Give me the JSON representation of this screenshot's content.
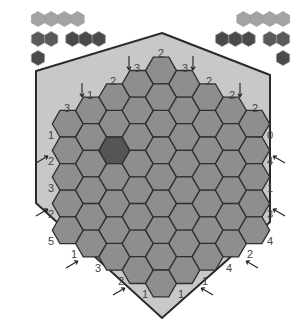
{
  "app": {
    "type": "hex-black-box-puzzle"
  },
  "colors": {
    "background": "#ffffff",
    "board_fill": "#c8c8c8",
    "board_border": "#2a2a2a",
    "cell_fill": "#8e8e8e",
    "cell_border": "#2f2f2f",
    "cell_marked": "#555555",
    "palette_light": "#a3a3a3",
    "palette_mid": "#5a5a5a",
    "palette_dark": "#4a4a4a",
    "label_text": "#444444"
  },
  "palette_left": {
    "rows": [
      {
        "groups": [
          {
            "count": 4,
            "shade": "light"
          }
        ]
      },
      {
        "groups": [
          {
            "count": 2,
            "shade": "mid"
          },
          {
            "count": 3,
            "shade": "dark"
          }
        ]
      },
      {
        "groups": [
          {
            "count": 1,
            "shade": "dark"
          }
        ]
      }
    ]
  },
  "palette_right": {
    "rows": [
      {
        "groups": [
          {
            "count": 4,
            "shade": "light"
          }
        ]
      },
      {
        "groups": [
          {
            "count": 3,
            "shade": "dark"
          },
          {
            "count": 2,
            "shade": "mid"
          }
        ]
      },
      {
        "groups": [
          {
            "count": 1,
            "shade": "dark"
          }
        ]
      }
    ]
  },
  "board": {
    "side": 5,
    "marked_cells": [
      [
        2,
        2
      ],
      [
        7,
        6
      ]
    ]
  },
  "edge_labels": [
    {
      "text": "2",
      "x": 161,
      "y": 53,
      "arrow": null
    },
    {
      "text": "3",
      "x": 137,
      "y": 68,
      "arrow": "down-left"
    },
    {
      "text": "3",
      "x": 185,
      "y": 68,
      "arrow": "down-right"
    },
    {
      "text": "2",
      "x": 113,
      "y": 81,
      "arrow": null
    },
    {
      "text": "2",
      "x": 209,
      "y": 81,
      "arrow": null
    },
    {
      "text": "1",
      "x": 90,
      "y": 95,
      "arrow": "down-left"
    },
    {
      "text": "2",
      "x": 232,
      "y": 95,
      "arrow": "down-right"
    },
    {
      "text": "3",
      "x": 67,
      "y": 108,
      "arrow": null
    },
    {
      "text": "2",
      "x": 255,
      "y": 108,
      "arrow": null
    },
    {
      "text": "1",
      "x": 51,
      "y": 135,
      "arrow": null
    },
    {
      "text": "0",
      "x": 270,
      "y": 135,
      "arrow": null
    },
    {
      "text": "2",
      "x": 51,
      "y": 161,
      "arrow": "in-left"
    },
    {
      "text": "4",
      "x": 270,
      "y": 161,
      "arrow": "in-right"
    },
    {
      "text": "3",
      "x": 51,
      "y": 188,
      "arrow": null
    },
    {
      "text": "1",
      "x": 270,
      "y": 188,
      "arrow": null
    },
    {
      "text": "2",
      "x": 51,
      "y": 214,
      "arrow": "in-left"
    },
    {
      "text": "3",
      "x": 270,
      "y": 214,
      "arrow": "in-right"
    },
    {
      "text": "5",
      "x": 51,
      "y": 241,
      "arrow": null
    },
    {
      "text": "4",
      "x": 270,
      "y": 241,
      "arrow": null
    },
    {
      "text": "1",
      "x": 74,
      "y": 254,
      "arrow": "up-left"
    },
    {
      "text": "2",
      "x": 250,
      "y": 254,
      "arrow": "up-right"
    },
    {
      "text": "3",
      "x": 98,
      "y": 268,
      "arrow": null
    },
    {
      "text": "4",
      "x": 229,
      "y": 268,
      "arrow": null
    },
    {
      "text": "2",
      "x": 121,
      "y": 281,
      "arrow": "up-left"
    },
    {
      "text": "1",
      "x": 205,
      "y": 281,
      "arrow": "up-right"
    },
    {
      "text": "1",
      "x": 145,
      "y": 294,
      "arrow": null
    },
    {
      "text": "1",
      "x": 181,
      "y": 294,
      "arrow": null
    }
  ]
}
